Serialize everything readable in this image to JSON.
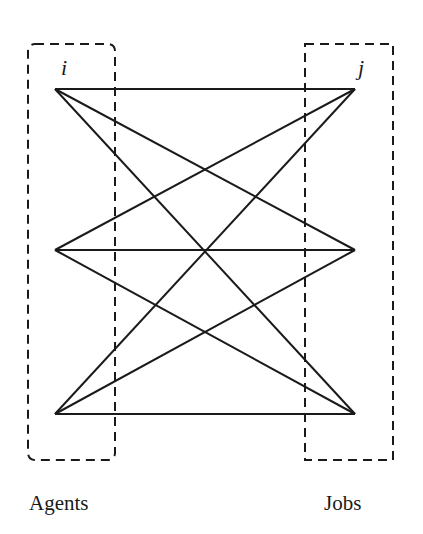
{
  "diagram": {
    "type": "bipartite-graph",
    "left_group": {
      "label": "Agents",
      "index_symbol": "i",
      "node_count": 3,
      "box_style": "dashed-rounded"
    },
    "right_group": {
      "label": "Jobs",
      "index_symbol": "j",
      "node_count": 3,
      "box_style": "dashed-square"
    },
    "edges": "complete bipartite (every agent connected to every job)",
    "colors": {
      "line": "#1a1a1a",
      "background": "#ffffff"
    }
  }
}
